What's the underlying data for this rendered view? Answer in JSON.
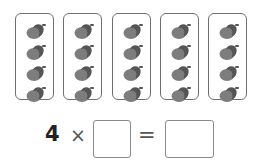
{
  "groups": {
    "count": 5,
    "items_per_group": 4,
    "item_icon": "acorn-icon",
    "box_lefts": [
      15,
      63,
      112,
      160,
      208
    ],
    "acorn_tops": [
      8,
      29,
      50,
      71
    ]
  },
  "equation": {
    "factor_known": "4",
    "times_symbol": "×",
    "equals_symbol": "=",
    "factor_blank_value": "",
    "product_blank_value": ""
  },
  "colors": {
    "nut": "#7d7d7d",
    "cap": "#555555",
    "border": "#6f6f6f"
  }
}
